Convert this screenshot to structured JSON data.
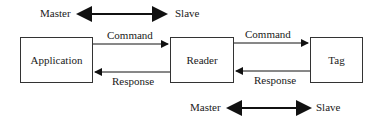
{
  "nodes": {
    "application": "Application",
    "reader": "Reader",
    "tag": "Tag"
  },
  "edges": {
    "app_to_reader": "Command",
    "reader_to_app": "Response",
    "reader_to_tag": "Command",
    "tag_to_reader": "Response"
  },
  "roles_top": {
    "left": "Master",
    "right": "Slave"
  },
  "roles_bottom": {
    "left": "Master",
    "right": "Slave"
  }
}
